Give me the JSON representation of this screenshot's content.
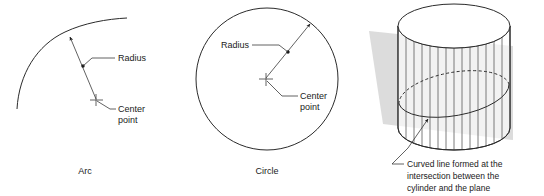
{
  "figure": {
    "title_alt": "Arc, circle and cylinder-plane intersection geometry diagram",
    "background_color": "#ffffff",
    "line_color": "#2b2b2b",
    "plane_color": "#d4d4d4"
  },
  "panels": [
    {
      "id": "arc",
      "caption": "Arc",
      "annotations": [
        {
          "id": "radius",
          "label": "Radius"
        },
        {
          "id": "center",
          "label_line1": "Center",
          "label_line2": "point"
        }
      ]
    },
    {
      "id": "circle",
      "caption": "Circle",
      "annotations": [
        {
          "id": "radius",
          "label": "Radius"
        },
        {
          "id": "center",
          "label_line1": "Center",
          "label_line2": "point"
        }
      ]
    },
    {
      "id": "cylinder",
      "caption": "",
      "annotations": [
        {
          "id": "intersection",
          "label_line1": "Curved line formed at the",
          "label_line2": "intersection between the",
          "label_line3": "cylinder and the plane"
        }
      ]
    }
  ],
  "arc_panel": {
    "caption": "Arc",
    "radius_label": "Radius",
    "center_label_line1": "Center",
    "center_label_line2": "point"
  },
  "circle_panel": {
    "caption": "Circle",
    "radius_label": "Radius",
    "center_label_line1": "Center",
    "center_label_line2": "point"
  },
  "cylinder_panel": {
    "caption_line1": "Curved line formed at the",
    "caption_line2": "intersection between the",
    "caption_line3": "cylinder and the plane"
  }
}
